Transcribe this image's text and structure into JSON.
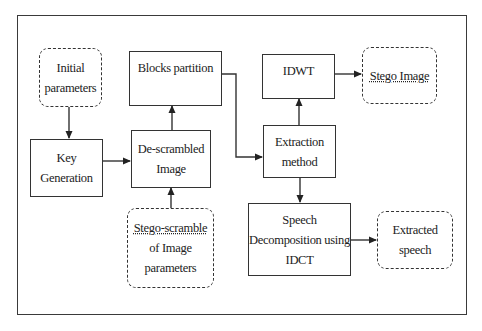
{
  "diagram": {
    "nodes": {
      "initial_parameters": {
        "lines": [
          "Initial",
          "parameters"
        ],
        "style": "dashed"
      },
      "key_generation": {
        "lines": [
          "Key",
          "Generation"
        ],
        "style": "solid"
      },
      "blocks_partition": {
        "lines": [
          "Blocks partition"
        ],
        "style": "solid"
      },
      "descrambled_image": {
        "lines": [
          "De-scrambled",
          "Image"
        ],
        "style": "solid"
      },
      "stego_scramble": {
        "lines": [
          "Stego-scramble",
          "of Image",
          "parameters"
        ],
        "style": "dashed"
      },
      "idwt": {
        "lines": [
          "IDWT"
        ],
        "style": "solid"
      },
      "extraction_method": {
        "lines": [
          "Extraction",
          "method"
        ],
        "style": "solid"
      },
      "speech_decomposition": {
        "lines": [
          "Speech",
          "Decomposition using",
          "IDCT"
        ],
        "style": "solid"
      },
      "stego_image": {
        "lines": [
          "Stego Image"
        ],
        "style": "dashed"
      },
      "extracted_speech": {
        "lines": [
          "Extracted",
          "speech"
        ],
        "style": "dashed"
      }
    },
    "edges": [
      {
        "from": "initial_parameters",
        "to": "key_generation"
      },
      {
        "from": "key_generation",
        "to": "descrambled_image"
      },
      {
        "from": "stego_scramble",
        "to": "descrambled_image"
      },
      {
        "from": "descrambled_image",
        "to": "blocks_partition"
      },
      {
        "from": "blocks_partition",
        "to": "extraction_method"
      },
      {
        "from": "extraction_method",
        "to": "idwt"
      },
      {
        "from": "idwt",
        "to": "stego_image"
      },
      {
        "from": "extraction_method",
        "to": "speech_decomposition"
      },
      {
        "from": "speech_decomposition",
        "to": "extracted_speech"
      }
    ]
  }
}
